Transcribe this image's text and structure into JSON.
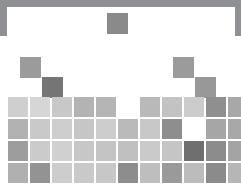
{
  "figure": {
    "title": "",
    "background_color": "#8e9094",
    "card_color": "#ffffff"
  },
  "chart_data": {
    "type": "heatmap",
    "title": "",
    "xlabel": "",
    "ylabel": "",
    "grid": false,
    "legend": "none",
    "layout": {
      "cell_width": 20,
      "cell_height": 20,
      "col_pitch": 22,
      "row_pitch": 22,
      "origin_x": 8,
      "origin_y": 97
    },
    "value_scale": {
      "min": 0.0,
      "max": 1.0,
      "colors": {
        "lightest": "#d9d9d9",
        "light": "#cfcfcf",
        "mid_light": "#c2c2c2",
        "mid": "#b4b4b4",
        "mid_dark": "#a3a3a3",
        "dark": "#8a8a8a",
        "darkest": "#757575"
      }
    },
    "cells": [
      {
        "name": "top-isolated-tile",
        "row": 0,
        "col": 5,
        "x": 107,
        "y": 13,
        "w": 21,
        "h": 21,
        "color": "#8a8a8a",
        "value": 0.62
      },
      {
        "name": "upper-left-tile",
        "row": 1,
        "col": 1,
        "x": 20,
        "y": 57,
        "w": 21,
        "h": 21,
        "color": "#9b9b9b",
        "value": 0.55
      },
      {
        "name": "upper-right-tile",
        "row": 1,
        "col": 8,
        "x": 173,
        "y": 57,
        "w": 21,
        "h": 21,
        "color": "#9b9b9b",
        "value": 0.55
      },
      {
        "name": "mid-left-tile",
        "row": 2,
        "col": 2,
        "x": 42,
        "y": 77,
        "w": 21,
        "h": 21,
        "color": "#757575",
        "value": 0.74
      },
      {
        "name": "mid-right-tile",
        "row": 2,
        "col": 9,
        "x": 195,
        "y": 77,
        "w": 21,
        "h": 21,
        "color": "#989898",
        "value": 0.57
      },
      {
        "name": "grid-r1-c1",
        "row": 3,
        "col": 1,
        "x": 8,
        "y": 97,
        "w": 20,
        "h": 20,
        "color": "#cfcfcf",
        "value": 0.22
      },
      {
        "name": "grid-r1-c2",
        "row": 3,
        "col": 2,
        "x": 30,
        "y": 97,
        "w": 20,
        "h": 20,
        "color": "#d6d6d6",
        "value": 0.19
      },
      {
        "name": "grid-r1-c3",
        "row": 3,
        "col": 3,
        "x": 52,
        "y": 97,
        "w": 20,
        "h": 20,
        "color": "#c8c8c8",
        "value": 0.25
      },
      {
        "name": "grid-r1-c4",
        "row": 3,
        "col": 4,
        "x": 74,
        "y": 97,
        "w": 20,
        "h": 20,
        "color": "#b3b3b3",
        "value": 0.34
      },
      {
        "name": "grid-r1-c5",
        "row": 3,
        "col": 5,
        "x": 96,
        "y": 97,
        "w": 20,
        "h": 20,
        "color": "#b5b5b5",
        "value": 0.33
      },
      {
        "name": "grid-r1-c7",
        "row": 3,
        "col": 7,
        "x": 140,
        "y": 97,
        "w": 20,
        "h": 20,
        "color": "#b9b9b9",
        "value": 0.31
      },
      {
        "name": "grid-r1-c8",
        "row": 3,
        "col": 8,
        "x": 162,
        "y": 97,
        "w": 20,
        "h": 20,
        "color": "#c3c3c3",
        "value": 0.27
      },
      {
        "name": "grid-r1-c9",
        "row": 3,
        "col": 9,
        "x": 184,
        "y": 97,
        "w": 20,
        "h": 20,
        "color": "#cccccc",
        "value": 0.23
      },
      {
        "name": "grid-r1-c10",
        "row": 3,
        "col": 10,
        "x": 206,
        "y": 97,
        "w": 20,
        "h": 20,
        "color": "#8f8f8f",
        "value": 0.6
      },
      {
        "name": "grid-r1-c11",
        "row": 3,
        "col": 11,
        "x": 228,
        "y": 97,
        "w": 13,
        "h": 20,
        "color": "#a8a8a8",
        "value": 0.41
      },
      {
        "name": "grid-r2-c1",
        "row": 4,
        "col": 1,
        "x": 8,
        "y": 119,
        "w": 20,
        "h": 20,
        "color": "#b2b2b2",
        "value": 0.35
      },
      {
        "name": "grid-r2-c2",
        "row": 4,
        "col": 2,
        "x": 30,
        "y": 119,
        "w": 20,
        "h": 20,
        "color": "#c9c9c9",
        "value": 0.24
      },
      {
        "name": "grid-r2-c3",
        "row": 4,
        "col": 3,
        "x": 52,
        "y": 119,
        "w": 20,
        "h": 20,
        "color": "#cecece",
        "value": 0.22
      },
      {
        "name": "grid-r2-c4",
        "row": 4,
        "col": 4,
        "x": 74,
        "y": 119,
        "w": 20,
        "h": 20,
        "color": "#c6c6c6",
        "value": 0.26
      },
      {
        "name": "grid-r2-c5",
        "row": 4,
        "col": 5,
        "x": 96,
        "y": 119,
        "w": 20,
        "h": 20,
        "color": "#cdcdcd",
        "value": 0.23
      },
      {
        "name": "grid-r2-c6",
        "row": 4,
        "col": 6,
        "x": 118,
        "y": 119,
        "w": 20,
        "h": 20,
        "color": "#bababa",
        "value": 0.31
      },
      {
        "name": "grid-r2-c7",
        "row": 4,
        "col": 7,
        "x": 140,
        "y": 119,
        "w": 20,
        "h": 20,
        "color": "#c8c8c8",
        "value": 0.25
      },
      {
        "name": "grid-r2-c8",
        "row": 4,
        "col": 8,
        "x": 162,
        "y": 119,
        "w": 20,
        "h": 20,
        "color": "#8e8e8e",
        "value": 0.61
      },
      {
        "name": "grid-r2-c10",
        "row": 4,
        "col": 10,
        "x": 206,
        "y": 119,
        "w": 20,
        "h": 20,
        "color": "#a6a6a6",
        "value": 0.43
      },
      {
        "name": "grid-r2-c11",
        "row": 4,
        "col": 11,
        "x": 228,
        "y": 119,
        "w": 13,
        "h": 20,
        "color": "#a8a8a8",
        "value": 0.41
      },
      {
        "name": "grid-r3-c1",
        "row": 5,
        "col": 1,
        "x": 8,
        "y": 141,
        "w": 20,
        "h": 20,
        "color": "#9d9d9d",
        "value": 0.52
      },
      {
        "name": "grid-r3-c2",
        "row": 5,
        "col": 2,
        "x": 30,
        "y": 141,
        "w": 20,
        "h": 20,
        "color": "#cbcbcb",
        "value": 0.23
      },
      {
        "name": "grid-r3-c3",
        "row": 5,
        "col": 3,
        "x": 52,
        "y": 141,
        "w": 20,
        "h": 20,
        "color": "#d0d0d0",
        "value": 0.21
      },
      {
        "name": "grid-r3-c4",
        "row": 5,
        "col": 4,
        "x": 74,
        "y": 141,
        "w": 20,
        "h": 20,
        "color": "#c7c7c7",
        "value": 0.25
      },
      {
        "name": "grid-r3-c5",
        "row": 5,
        "col": 5,
        "x": 96,
        "y": 141,
        "w": 20,
        "h": 20,
        "color": "#c4c4c4",
        "value": 0.27
      },
      {
        "name": "grid-r3-c6",
        "row": 5,
        "col": 6,
        "x": 118,
        "y": 141,
        "w": 20,
        "h": 20,
        "color": "#c0c0c0",
        "value": 0.29
      },
      {
        "name": "grid-r3-c7",
        "row": 5,
        "col": 7,
        "x": 140,
        "y": 141,
        "w": 20,
        "h": 20,
        "color": "#cacaca",
        "value": 0.24
      },
      {
        "name": "grid-r3-c8",
        "row": 5,
        "col": 8,
        "x": 162,
        "y": 141,
        "w": 20,
        "h": 20,
        "color": "#c5c5c5",
        "value": 0.26
      },
      {
        "name": "grid-r3-c9",
        "row": 5,
        "col": 9,
        "x": 184,
        "y": 141,
        "w": 20,
        "h": 20,
        "color": "#6f6f6f",
        "value": 0.78
      },
      {
        "name": "grid-r3-c10",
        "row": 5,
        "col": 10,
        "x": 206,
        "y": 141,
        "w": 20,
        "h": 20,
        "color": "#8c8c8c",
        "value": 0.63
      },
      {
        "name": "grid-r3-c11",
        "row": 5,
        "col": 11,
        "x": 228,
        "y": 141,
        "w": 13,
        "h": 20,
        "color": "#a4a4a4",
        "value": 0.44
      },
      {
        "name": "grid-r4-c1",
        "row": 6,
        "col": 1,
        "x": 8,
        "y": 163,
        "w": 20,
        "h": 20,
        "color": "#b0b0b0",
        "value": 0.36
      },
      {
        "name": "grid-r4-c2",
        "row": 6,
        "col": 2,
        "x": 30,
        "y": 163,
        "w": 20,
        "h": 20,
        "color": "#939393",
        "value": 0.58
      },
      {
        "name": "grid-r4-c3",
        "row": 6,
        "col": 3,
        "x": 52,
        "y": 163,
        "w": 20,
        "h": 20,
        "color": "#cdcdcd",
        "value": 0.23
      },
      {
        "name": "grid-r4-c4",
        "row": 6,
        "col": 4,
        "x": 74,
        "y": 163,
        "w": 20,
        "h": 20,
        "color": "#c9c9c9",
        "value": 0.24
      },
      {
        "name": "grid-r4-c5",
        "row": 6,
        "col": 5,
        "x": 96,
        "y": 163,
        "w": 20,
        "h": 20,
        "color": "#c7c7c7",
        "value": 0.25
      },
      {
        "name": "grid-r4-c6",
        "row": 6,
        "col": 6,
        "x": 118,
        "y": 163,
        "w": 20,
        "h": 20,
        "color": "#8d8d8d",
        "value": 0.62
      },
      {
        "name": "grid-r4-c7",
        "row": 6,
        "col": 7,
        "x": 140,
        "y": 163,
        "w": 20,
        "h": 20,
        "color": "#bebebe",
        "value": 0.3
      },
      {
        "name": "grid-r4-c8",
        "row": 6,
        "col": 8,
        "x": 162,
        "y": 163,
        "w": 20,
        "h": 20,
        "color": "#9a9a9a",
        "value": 0.54
      },
      {
        "name": "grid-r4-c9",
        "row": 6,
        "col": 9,
        "x": 184,
        "y": 163,
        "w": 20,
        "h": 20,
        "color": "#bcbcbc",
        "value": 0.31
      },
      {
        "name": "grid-r4-c10",
        "row": 6,
        "col": 10,
        "x": 206,
        "y": 163,
        "w": 20,
        "h": 20,
        "color": "#8b8b8b",
        "value": 0.63
      },
      {
        "name": "grid-r4-c11",
        "row": 6,
        "col": 11,
        "x": 228,
        "y": 163,
        "w": 13,
        "h": 20,
        "color": "#b6b6b6",
        "value": 0.33
      }
    ]
  }
}
